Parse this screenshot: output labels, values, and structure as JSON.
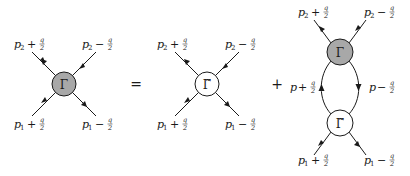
{
  "diagram": {
    "colors": {
      "full_vertex_fill": "#a8a8a8",
      "irreducible_vertex_fill": "#ffffff",
      "stroke": "#1a1a1a"
    },
    "operators": {
      "equals": "=",
      "plus": "+"
    },
    "vertices": {
      "full": {
        "symbol": "Γ",
        "fill": "#a8a8a8"
      },
      "irreducible": {
        "symbol": "Γ̃",
        "fill": "#ffffff"
      }
    },
    "panels": [
      {
        "name": "lhs-full-vertex",
        "vertex": "Γ",
        "legs": [
          {
            "label_main": "p",
            "sub": "2",
            "sign": "+",
            "num": "q",
            "den": "2",
            "position": "top-left",
            "arrow": "outgoing"
          },
          {
            "label_main": "p",
            "sub": "2",
            "sign": "−",
            "num": "q",
            "den": "2",
            "position": "top-right",
            "arrow": "incoming"
          },
          {
            "label_main": "p",
            "sub": "1",
            "sign": "+",
            "num": "q",
            "den": "2",
            "position": "bottom-left",
            "arrow": "incoming"
          },
          {
            "label_main": "p",
            "sub": "1",
            "sign": "−",
            "num": "q",
            "den": "2",
            "position": "bottom-right",
            "arrow": "outgoing"
          }
        ]
      },
      {
        "name": "rhs-irreducible-vertex",
        "vertex": "Γ̃",
        "legs": [
          {
            "label_main": "p",
            "sub": "2",
            "sign": "+",
            "num": "q",
            "den": "2",
            "position": "top-left",
            "arrow": "outgoing"
          },
          {
            "label_main": "p",
            "sub": "2",
            "sign": "−",
            "num": "q",
            "den": "2",
            "position": "top-right",
            "arrow": "incoming"
          },
          {
            "label_main": "p",
            "sub": "1",
            "sign": "+",
            "num": "q",
            "den": "2",
            "position": "bottom-left",
            "arrow": "incoming"
          },
          {
            "label_main": "p",
            "sub": "1",
            "sign": "−",
            "num": "q",
            "den": "2",
            "position": "bottom-right",
            "arrow": "outgoing"
          }
        ]
      },
      {
        "name": "rhs-ladder",
        "top_vertex": "Γ",
        "bottom_vertex": "Γ̃",
        "legs": [
          {
            "label_main": "p",
            "sub": "2",
            "sign": "+",
            "num": "q",
            "den": "2",
            "position": "top-left",
            "arrow": "outgoing"
          },
          {
            "label_main": "p",
            "sub": "2",
            "sign": "−",
            "num": "q",
            "den": "2",
            "position": "top-right",
            "arrow": "incoming"
          },
          {
            "label_main": "p",
            "sub": "1",
            "sign": "+",
            "num": "q",
            "den": "2",
            "position": "bottom-left",
            "arrow": "incoming"
          },
          {
            "label_main": "p",
            "sub": "1",
            "sign": "−",
            "num": "q",
            "den": "2",
            "position": "bottom-right",
            "arrow": "outgoing"
          }
        ],
        "internal": [
          {
            "label_main": "p",
            "sign": "+",
            "num": "q",
            "den": "2",
            "side": "left",
            "arrow": "up"
          },
          {
            "label_main": "p",
            "sign": "−",
            "num": "q",
            "den": "2",
            "side": "right",
            "arrow": "down"
          }
        ]
      }
    ]
  }
}
